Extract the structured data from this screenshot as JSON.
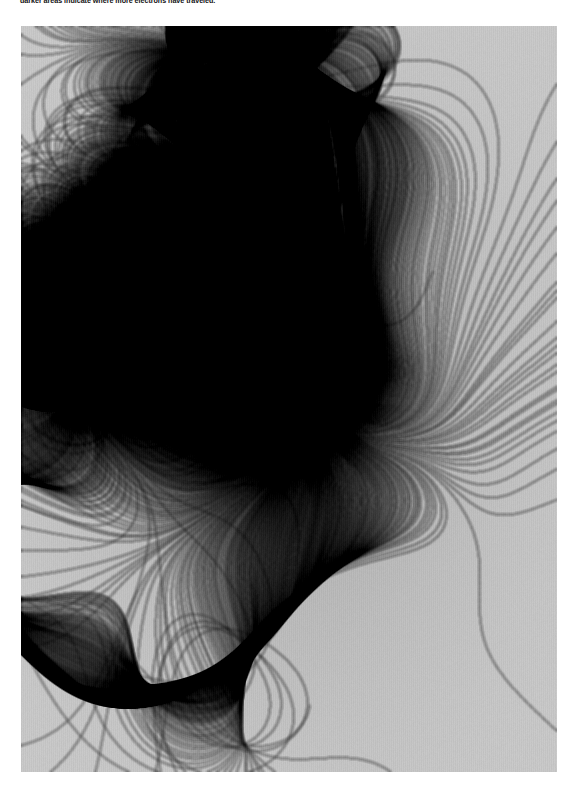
{
  "caption": {
    "text": "darker areas indicate where more electrons have traveled."
  },
  "figure": {
    "alt_label": "electron-branched-flow-density-map",
    "panel_left": 21,
    "panel_top": 26,
    "panel_width": 536,
    "panel_height": 746,
    "background_gray": "#c9c9c9"
  },
  "chart_data": {
    "type": "heatmap",
    "title": "",
    "subtitle": "",
    "xlabel": "",
    "ylabel": "",
    "caption": "darker areas indicate where more electrons have traveled.",
    "legend": [],
    "grid": false,
    "colormap": "grayscale",
    "colormap_note": "dark = high electron density, light = low electron density",
    "value_label": "electron density (arbitrary units)",
    "value_range": [
      0,
      1
    ],
    "xlim": [
      0,
      536
    ],
    "ylim": [
      0,
      746
    ],
    "tick_labels_x": [],
    "tick_labels_y": [],
    "background_level": 0.22,
    "annotations": [],
    "features": {
      "emitter_center_x": 274,
      "emitter_center_y": 374,
      "core_radius": 38,
      "core_level": 0.97,
      "petal_count": 11,
      "description": "radial branched-flow caustic network emanating from a central point source"
    },
    "petals": [
      {
        "angle_deg": -90,
        "length": 150,
        "width_deg": 20,
        "brightness": 0.93
      },
      {
        "angle_deg": -62,
        "length": 132,
        "width_deg": 17,
        "brightness": 0.9
      },
      {
        "angle_deg": -30,
        "length": 140,
        "width_deg": 18,
        "brightness": 0.92
      },
      {
        "angle_deg": -4,
        "length": 120,
        "width_deg": 16,
        "brightness": 0.88
      },
      {
        "angle_deg": 24,
        "length": 146,
        "width_deg": 19,
        "brightness": 0.91
      },
      {
        "angle_deg": 56,
        "length": 134,
        "width_deg": 18,
        "brightness": 0.9
      },
      {
        "angle_deg": 88,
        "length": 124,
        "width_deg": 16,
        "brightness": 0.87
      },
      {
        "angle_deg": 120,
        "length": 138,
        "width_deg": 18,
        "brightness": 0.9
      },
      {
        "angle_deg": 152,
        "length": 128,
        "width_deg": 17,
        "brightness": 0.89
      },
      {
        "angle_deg": 178,
        "length": 142,
        "width_deg": 19,
        "brightness": 0.92
      },
      {
        "angle_deg": 208,
        "length": 126,
        "width_deg": 16,
        "brightness": 0.88
      }
    ],
    "branch_rays_deg": [
      -96,
      -84,
      -72,
      -60,
      -48,
      -36,
      -24,
      -12,
      0,
      12,
      24,
      36,
      48,
      60,
      72,
      84,
      96,
      108,
      120,
      132,
      144,
      156,
      168,
      180,
      192,
      204,
      216,
      228,
      240,
      252,
      264,
      276
    ],
    "intensity_profile": {
      "radius_px": [
        0,
        20,
        40,
        70,
        110,
        160,
        230,
        320,
        430
      ],
      "mean_value": [
        0.98,
        0.92,
        0.68,
        0.46,
        0.36,
        0.31,
        0.27,
        0.24,
        0.22
      ]
    }
  }
}
